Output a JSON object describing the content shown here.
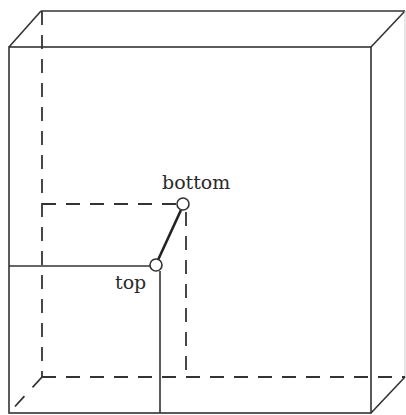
{
  "diagram": {
    "labels": {
      "bottom": "bottom",
      "top": "top"
    },
    "colors": {
      "line": "#333333",
      "background": "#ffffff"
    }
  }
}
